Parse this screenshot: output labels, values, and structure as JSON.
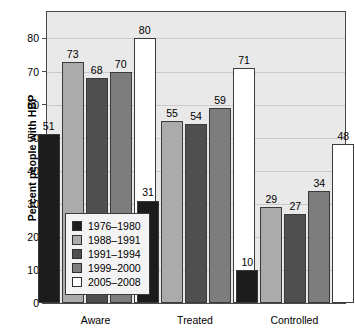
{
  "chart_data": {
    "type": "bar",
    "title": "",
    "subtitle": "",
    "xlabel": "",
    "ylabel": "Percent people with HBP",
    "ylim": [
      0,
      88
    ],
    "yticks": [
      0,
      10,
      20,
      30,
      40,
      50,
      60,
      70,
      80
    ],
    "grid": true,
    "legend_position": "inside-lower-left",
    "categories": [
      "Aware",
      "Treated",
      "Controlled"
    ],
    "series": [
      {
        "name": "1976–1980",
        "color": "#1c1c1c",
        "values": [
          51,
          31,
          10
        ]
      },
      {
        "name": "1988–1991",
        "color": "#ababab",
        "values": [
          73,
          55,
          29
        ]
      },
      {
        "name": "1991–1994",
        "color": "#4f4f4f",
        "values": [
          68,
          54,
          27
        ]
      },
      {
        "name": "1999–2000",
        "color": "#7d7d7d",
        "values": [
          70,
          59,
          34
        ]
      },
      {
        "name": "2005–2008",
        "color": "#ffffff",
        "values": [
          80,
          71,
          48
        ]
      }
    ],
    "data_labels": [
      [
        "51",
        "73",
        "68",
        "70",
        "80"
      ],
      [
        "31",
        "55",
        "54",
        "59",
        "71"
      ],
      [
        "10",
        "29",
        "27",
        "34",
        "48"
      ]
    ],
    "legend_entries": [
      "1976–1980",
      "1988–1991",
      "1991–1994",
      "1999–2000",
      "2005–2008"
    ],
    "colors": {
      "plot_background": "#e9e9e9",
      "figure_background": "#ffffff",
      "axis": "#4a4a4a",
      "gridline": "#c9c9c9",
      "legend_background": "#f3f3f3",
      "text": "#000000"
    }
  }
}
